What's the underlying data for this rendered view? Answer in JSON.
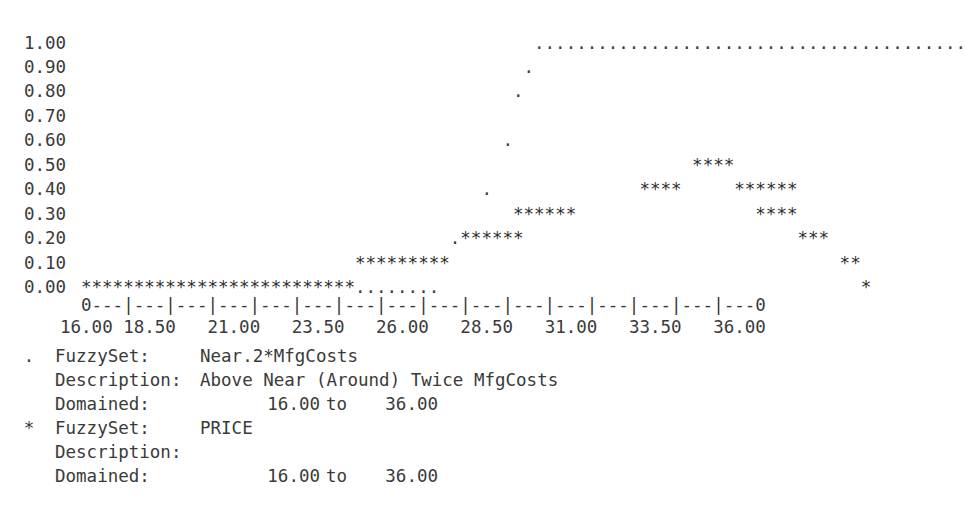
{
  "chart_data": {
    "type": "line",
    "title": "",
    "xlabel": "",
    "ylabel": "",
    "style": "ascii-art-terminal-plot",
    "grid": false,
    "legend_position": "below-axis",
    "xlim": [
      16.0,
      36.0
    ],
    "ylim": [
      0.0,
      1.0
    ],
    "y_ticklabels": [
      "1.00",
      "0.90",
      "0.80",
      "0.70",
      "0.60",
      "0.50",
      "0.40",
      "0.30",
      "0.20",
      "0.10",
      "0.00"
    ],
    "y_tickvalues": [
      1.0,
      0.9,
      0.8,
      0.7,
      0.6,
      0.5,
      0.4,
      0.3,
      0.2,
      0.1,
      0.0
    ],
    "x_ticklabels": [
      "16.00",
      "18.50",
      "21.00",
      "23.50",
      "26.00",
      "28.50",
      "31.00",
      "33.50",
      "36.00"
    ],
    "x_tickvalues": [
      16.0,
      18.5,
      21.0,
      23.5,
      26.0,
      28.5,
      31.0,
      33.5,
      36.0
    ],
    "axis_line": "0---|---|---|---|---|---|---|---|---|---|---|---|---|---|---|---0",
    "series": [
      {
        "name": "Near.2*MfgCosts",
        "marker": ".",
        "rows": [
          {
            "y": 1.0,
            "start_col": 43,
            "count": 41
          },
          {
            "y": 0.9,
            "start_col": 42,
            "count": 1
          },
          {
            "y": 0.8,
            "start_col": 41,
            "count": 1
          },
          {
            "y": 0.7,
            "start_col": 0,
            "count": 0
          },
          {
            "y": 0.6,
            "start_col": 40,
            "count": 1
          },
          {
            "y": 0.5,
            "start_col": 0,
            "count": 0
          },
          {
            "y": 0.4,
            "start_col": 38,
            "count": 1
          },
          {
            "y": 0.3,
            "start_col": 0,
            "count": 0
          },
          {
            "y": 0.2,
            "start_col": 37,
            "count": 1
          },
          {
            "y": 0.1,
            "start_col": 0,
            "count": 0
          },
          {
            "y": 0.0,
            "start_col": 26,
            "count": 8
          }
        ]
      },
      {
        "name": "PRICE",
        "marker": "*",
        "rows": [
          {
            "y": 1.0,
            "start_col": 0,
            "count": 0
          },
          {
            "y": 0.9,
            "start_col": 0,
            "count": 0
          },
          {
            "y": 0.8,
            "start_col": 0,
            "count": 0
          },
          {
            "y": 0.7,
            "start_col": 0,
            "count": 0
          },
          {
            "y": 0.6,
            "start_col": 0,
            "count": 0
          },
          {
            "y": 0.5,
            "start_col": 58,
            "count": 4
          },
          {
            "y": 0.4,
            "start_col": 53,
            "count": 4
          },
          {
            "y": 0.4,
            "start_col": 63,
            "count": 6
          },
          {
            "y": 0.3,
            "start_col": 41,
            "count": 6
          },
          {
            "y": 0.3,
            "start_col": 70,
            "count": 4
          },
          {
            "y": 0.2,
            "start_col": 35,
            "count": 6
          },
          {
            "y": 0.2,
            "start_col": 75,
            "count": 3
          },
          {
            "y": 0.1,
            "start_col": 26,
            "count": 9
          },
          {
            "y": 0.1,
            "start_col": 80,
            "count": 2
          },
          {
            "y": 0.0,
            "start_col": 0,
            "count": 26
          },
          {
            "y": 0.0,
            "start_col": 83,
            "count": 1
          }
        ]
      }
    ],
    "rendered_rows": [
      {
        "label": "1.00",
        "text": "                                           ........................................."
      },
      {
        "label": "0.90",
        "text": "                                          ."
      },
      {
        "label": "0.80",
        "text": "                                         ."
      },
      {
        "label": "0.70",
        "text": ""
      },
      {
        "label": "0.60",
        "text": "                                        ."
      },
      {
        "label": "0.50",
        "text": "                                                          ****"
      },
      {
        "label": "0.40",
        "text": "                                      .              ****     ******"
      },
      {
        "label": "0.30",
        "text": "                                         ******                 ****"
      },
      {
        "label": "0.20",
        "text": "                                   .******                          ***"
      },
      {
        "label": "0.10",
        "text": "                          *********                                     **"
      },
      {
        "label": "0.00",
        "text": "**************************........                                        *"
      }
    ]
  },
  "legend": {
    "entries": [
      {
        "marker": ".",
        "fuzzyset_key": "FuzzySet:",
        "fuzzyset_value": "Near.2*MfgCosts",
        "description_key": "Description:",
        "description_value": "Above Near (Around) Twice MfgCosts",
        "domained_key": "Domained:",
        "domained_from": "16.00",
        "domained_to_word": "to",
        "domained_upper": "36.00"
      },
      {
        "marker": "*",
        "fuzzyset_key": "FuzzySet:",
        "fuzzyset_value": "PRICE",
        "description_key": "Description:",
        "description_value": "",
        "domained_key": "Domained:",
        "domained_from": "16.00",
        "domained_to_word": "to",
        "domained_upper": "36.00"
      }
    ]
  },
  "colors": {
    "background": "#ffffff",
    "text": "#3a3a3a",
    "marker": "#2f2f2f"
  }
}
